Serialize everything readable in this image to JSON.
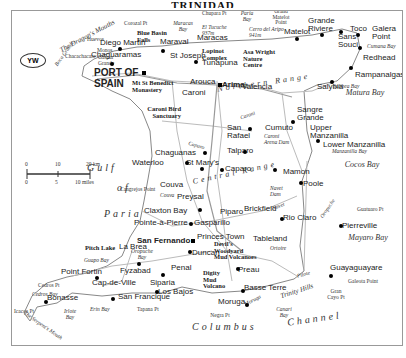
{
  "title": "TRINIDAD",
  "map": {
    "country_code": "YW",
    "scale": {
      "km_ticks": [
        "0",
        "10",
        "20 km"
      ],
      "mile_ticks": [
        "0",
        "5",
        "10 miles"
      ]
    },
    "seas": {
      "gulf_of_paria_1": "Gulf",
      "gulf_of_paria_2": "of",
      "gulf_of_paria_3": "Paria",
      "columbus_channel_1": "Columbus",
      "columbus_channel_2": "Channel"
    },
    "ranges": {
      "northern": "Northern Range",
      "central": "Central Range"
    },
    "bays": {
      "matura": "Matura Bay",
      "cocos": "Cocos Bay",
      "mayaro": "Mayaro Bay"
    },
    "cities": {
      "capital": "PORT OF SPAIN",
      "san_fernando": "San Fernando",
      "arima": "Arima"
    },
    "towns": [
      "Diego Martin",
      "Chaguaramas",
      "Maraval",
      "Maracas",
      "St Joseph",
      "Tunapuna",
      "Arouca",
      "Caroni",
      "Matelot",
      "Grande Riviere",
      "Toco",
      "Sans Souci",
      "Galera Point",
      "Redhead",
      "Rampanalgas",
      "Salybia",
      "Valencia",
      "Sangre Grande",
      "Upper Manzanilla",
      "Lower Manzanilla",
      "San Rafael",
      "Cumuto",
      "Talparo",
      "Chaguanas",
      "Waterloo",
      "St Mary's",
      "Caparo",
      "Mamon",
      "Poole",
      "Couva",
      "Preysal",
      "Claxton Bay",
      "Pointe-à-Pierre",
      "Gasparillo",
      "Piparo",
      "Brickfield",
      "Rio Claro",
      "Pierreville",
      "Princes Town",
      "Tableland",
      "Duncan",
      "La Brea",
      "Point Fortin",
      "Fyzabad",
      "Penal",
      "Siparia",
      "Cap-de-Ville",
      "Bonasse",
      "San Francique",
      "Los Bajos",
      "Moruga",
      "Basse Terre",
      "Preau",
      "Guayaguayare",
      "Icacos Pt"
    ],
    "poi": [
      "Blue Basin Falls",
      "Lopinot Complex",
      "Asa Wright Nature Centre",
      "Mt St Benedict Monastery",
      "Caroni Bird Sanctuary",
      "Pitch Lake",
      "Devil's Woodyard Mud Volcanoes",
      "Digity Mud Volcano"
    ],
    "features": [
      "Boca Grande",
      "The Dragon's Mouths",
      "Huevos",
      "Monos",
      "Chacachacare",
      "Gaspar Grande",
      "Corozal Pt",
      "Maracas Bay",
      "Chupara Pt",
      "Paria Bay",
      "Grand Matelot Point",
      "El Tucuche 937m",
      "Cerro del Aripo 941m",
      "Cumana Bay",
      "Salibea Bay",
      "Manzanilla Bay",
      "Caroni",
      "Caroni Arena Dam",
      "Navet Dam",
      "Navet",
      "Caparo",
      "Couva",
      "Cangrejos Point",
      "Oropuche",
      "Ortoire",
      "Pilote",
      "Guatuaro Pt",
      "Galeota Point",
      "Gran Cayo Pt",
      "Trinity Hills",
      "Moruga",
      "Canari Bay",
      "Negra Pt",
      "Tapana Pt",
      "Erin Bay",
      "Irlote Bay",
      "Cedros Pt",
      "Cedros Bay",
      "Guapo Bay",
      "Oropuche Bay",
      "The Serpent's Mouth"
    ]
  }
}
